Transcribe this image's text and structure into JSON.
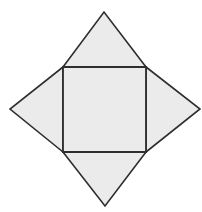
{
  "diagram": {
    "title": "",
    "colors": {
      "background": "#ffffff",
      "fill": "#ebebeb",
      "stroke": "#2e2e2e"
    },
    "square": {
      "name": "base",
      "points": [
        [
          63,
          67
        ],
        [
          146,
          67
        ],
        [
          146,
          152
        ],
        [
          63,
          152
        ]
      ]
    },
    "triangles": [
      {
        "name": "top-face",
        "points": [
          [
            63,
            67
          ],
          [
            104,
            12
          ],
          [
            146,
            67
          ]
        ]
      },
      {
        "name": "right-face",
        "points": [
          [
            146,
            67
          ],
          [
            200,
            109
          ],
          [
            146,
            152
          ]
        ]
      },
      {
        "name": "bottom-face",
        "points": [
          [
            146,
            152
          ],
          [
            105,
            206
          ],
          [
            63,
            152
          ]
        ]
      },
      {
        "name": "left-face",
        "points": [
          [
            63,
            152
          ],
          [
            10,
            109
          ],
          [
            63,
            67
          ]
        ]
      }
    ]
  }
}
